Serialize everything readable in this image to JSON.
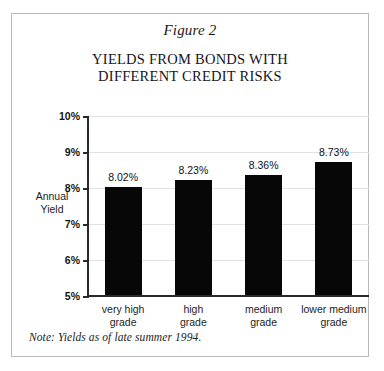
{
  "figure": {
    "label": "Figure 2",
    "title_line1": "YIELDS FROM BONDS WITH",
    "title_line2": "DIFFERENT CREDIT RISKS",
    "note": "Note: Yields as of late summer 1994.",
    "border_color": "#b9b9bc",
    "background": "#ffffff"
  },
  "chart_data": {
    "type": "bar",
    "title": "YIELDS FROM BONDS WITH DIFFERENT CREDIT RISKS",
    "subtitle": "Figure 2",
    "categories": [
      "very high grade",
      "high grade",
      "medium grade",
      "lower medium grade"
    ],
    "category_lines": [
      [
        "very high",
        "grade"
      ],
      [
        "high",
        "grade"
      ],
      [
        "medium",
        "grade"
      ],
      [
        "lower medium",
        "grade"
      ]
    ],
    "values": [
      8.02,
      8.23,
      8.36,
      8.73
    ],
    "value_labels": [
      "8.02%",
      "8.23%",
      "8.36%",
      "8.73%"
    ],
    "xlabel": "",
    "ylabel": "Annual Yield",
    "ylabel_lines": [
      "Annual",
      "Yield"
    ],
    "ylim": [
      5,
      10
    ],
    "ytick_values": [
      5,
      6,
      7,
      8,
      9,
      10
    ],
    "ytick_labels": [
      "5%",
      "6%",
      "7%",
      "8%",
      "9%",
      "10%"
    ],
    "grid": true,
    "legend": false,
    "bar_color": "#070707",
    "gridline_color": "#e2e2e4",
    "axis_color": "#2a2a2a",
    "annotation": "Note: Yields as of late summer 1994."
  }
}
